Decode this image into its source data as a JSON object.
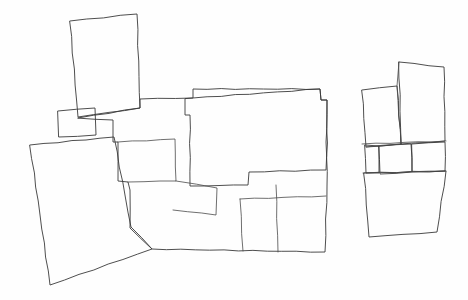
{
  "figure": {
    "kind": "line-drawing",
    "width": 468,
    "height": 300,
    "background_color": "#fefefe",
    "stroke_color": "#3a3a3a",
    "hatch_angle_degrees": 45,
    "fill_styles": {
      "light": {
        "name": "light-hatch",
        "color": "#9a9a9a",
        "spacing_px": 5.2,
        "line_width_px": 0.75
      },
      "dark": {
        "name": "dark-hatch",
        "color": "#6e6e6e",
        "spacing_px": 2.1,
        "line_width_px": 0.7
      }
    },
    "shapes": [
      {
        "id": "top-left-dark-block",
        "name": "top-left-dark-block",
        "fill": "dark",
        "points": "70,21 137,14 140,108 78,117"
      },
      {
        "id": "small-dark-box-left",
        "name": "small-dark-box-left",
        "fill": "dark",
        "points": "58,111 95,108 96,135 59,137"
      },
      {
        "id": "central-dark-block",
        "name": "central-dark-block",
        "fill": "dark",
        "points": "193,98 320,89 321,100 327,100 326,170 249,172 248,185 190,186 190,115 185,115 185,99"
      },
      {
        "id": "right-small-dark-square",
        "name": "right-small-dark-square",
        "fill": "dark",
        "points": "379,146 411,144 412,172 380,174"
      },
      {
        "id": "main-light-body",
        "name": "main-light-body",
        "fill": "light",
        "points": "78,118 140,108 140,99 193,98 193,89 320,89 321,100 327,100 327,186 325,252 152,249 130,228 130,190 128,182 118,181 118,142 113,142 113,120"
      },
      {
        "id": "lower-left-light-parcel",
        "name": "lower-left-light-parcel",
        "fill": "light",
        "points": "30,145 114,137 131,227 152,249 50,285"
      },
      {
        "id": "right-light-upper-left-parcel",
        "name": "right-light-upper-left-parcel",
        "fill": "light",
        "points": "362,90 397,86 401,144 366,147"
      },
      {
        "id": "right-light-upper-right-parcel",
        "name": "right-light-upper-right-parcel",
        "fill": "light",
        "points": "399,62 444,67 445,141 401,144"
      },
      {
        "id": "right-light-mid-left-parcel",
        "name": "right-light-mid-left-parcel",
        "fill": "light",
        "points": "365,145 379,146 379,173 366,173"
      },
      {
        "id": "right-light-mid-right-parcel",
        "name": "right-light-mid-right-parcel",
        "fill": "light",
        "points": "412,144 445,142 445,171 412,172"
      },
      {
        "id": "right-light-lower-parcel",
        "name": "right-light-lower-parcel",
        "fill": "light",
        "points": "364,173 446,171 437,232 369,237"
      }
    ],
    "internal_lines": [
      {
        "id": "div-mid-vertical-left",
        "name": "division-line-mid-vertical-left",
        "points": "118,142 175,139 176,181 128,182"
      },
      {
        "id": "div-notch-wedge",
        "name": "division-line-notch-wedge",
        "points": "176,181 217,188 216,215 173,210"
      },
      {
        "id": "div-bottom-right-upper",
        "name": "division-line-bottom-right-upper",
        "points": "240,199 326,196"
      },
      {
        "id": "div-bottom-right-vertical-a",
        "name": "division-line-bottom-right-vertical-a",
        "points": "240,199 243,251"
      },
      {
        "id": "div-bottom-right-vertical-b",
        "name": "division-line-bottom-right-vertical-b",
        "points": "276,185 278,252"
      },
      {
        "id": "div-right-upper-split",
        "name": "division-line-right-upper-split",
        "points": "366,147 401,144"
      },
      {
        "id": "div-right-band-top",
        "name": "division-line-right-band-top",
        "points": "362,144 446,141"
      },
      {
        "id": "div-right-band-bottom",
        "name": "division-line-right-band-bottom",
        "points": "363,173 446,171"
      },
      {
        "id": "div-right-vertical-upper",
        "name": "division-line-right-vertical-upper",
        "points": "399,62 397,86 401,144"
      }
    ]
  }
}
